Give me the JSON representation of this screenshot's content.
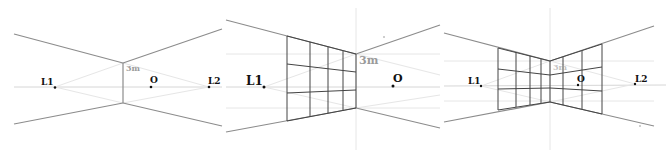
{
  "figure": {
    "panels": [
      {
        "id": "panel-1",
        "labels": {
          "left_vp": "L1",
          "observer": "O",
          "right_vp": "L2",
          "height": "3m"
        }
      },
      {
        "id": "panel-2",
        "labels": {
          "left_vp": "L1",
          "observer": "O",
          "height": "3m"
        },
        "grid": {
          "columns": 4,
          "rows": 3
        }
      },
      {
        "id": "panel-3",
        "labels": {
          "left_vp": "L1",
          "observer": "O",
          "right_vp": "L2",
          "height": "3m"
        },
        "grid_left": {
          "columns": 4,
          "rows": 3
        },
        "grid_right": {
          "columns": 3,
          "rows": 3
        }
      }
    ]
  },
  "colors": {
    "background": "#ffffff",
    "construction_lines": "#8c8c8c",
    "guide_lines": "#d6d6d6",
    "grid_lines": "#444444",
    "height_label": "#9a9a9a",
    "point_labels": "#111111"
  }
}
